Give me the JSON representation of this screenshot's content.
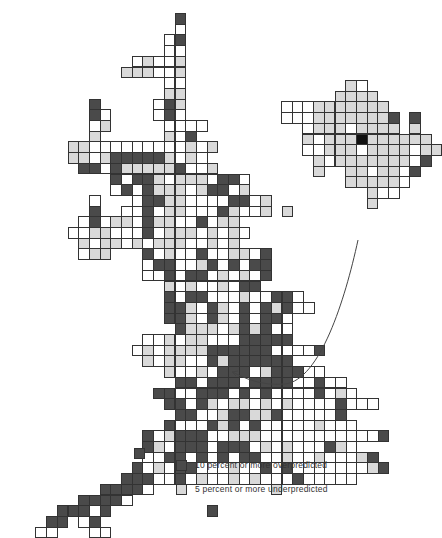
{
  "figure": {
    "type": "grid cartogram map",
    "cell_size": 10.7,
    "main_map_origin": [
      14,
      13
    ],
    "main_map_rows": [
      "...............d",
      "...............w",
      "..............wd",
      "..............ww",
      "...........wgwwg",
      "..........gggwwg",
      "..............ww",
      "..............gg",
      ".......d.....wdg",
      ".......dw....wdw",
      ".......wg.....wwww",
      ".......g......gwd",
      ".....ggwwwwwwwwwgwg",
      ".....ggwgdddddgwgw",
      "......ddwdgggggdwwg",
      ".........dwddgwgggwddw",
      ".........wdwdgggwgddwg",
      ".......w...wddggwwwwddwg",
      ".......d..wwdwggwwwdgwwg.g",
      "......wdwggwdggwwdwgg",
      ".....wwggwwwdwgggwgwgw",
      "......gwggwgwgggwwgwg",
      "......wgg...dwgwwdwwggwd",
      "............wddwwgdwdwdd",
      "............wwdwddwgwgwd",
      "..............gwgwwgwdd",
      "..............dwddwwwgwwddw",
      "..............ddgwdgwdwdgdww",
      "..............ddgwdgwdwddw",
      "...............dgggwgdgdww",
      "............wwgwggwwwddddd",
      "...........wgwggggddddddwwwwd",
      "............gwggwwdgdddddd",
      "..............gwwgwdddwgdddww",
      "...............ddwdddwddddwwdww",
      ".............ddwwdddwdwdwwwwdwgw",
      "..............ddwdgwggwgwgwwwwdwww",
      "...............ddwwgddggdwwwwwd",
      "..............dwwwdgdwdwwwwwgwww",
      "............dwgdddwwgggwwwwwwwwwwwd",
      "............dgwdddwdddwgwgwwwdgw",
      "............wwddwdwdwddwwgwwgwwwgd",
      "...........dwgwddwwwgwwdwdwwwwwwwgd",
      "..........dddwwdwgwwgwgwwwdwwwww",
      "........ddddw...........g",
      "......ddddw",
      "....dddwd.........d",
      "...dd.wd",
      "..ww...ww"
    ],
    "inset_map_origin": [
      281,
      80
    ],
    "inset_map_rows": [
      "......gw",
      ".....gggg",
      "wwwggggggg",
      "wwwgggggggd.d",
      "..wgggwgggg.g",
      "..gwgggkgggggg",
      "..wwgggwggggwgg",
      "...gwgggggggwd",
      "...g..ggwggwd",
      "......gggggw",
      "........gww",
      "........g"
    ]
  },
  "legend": {
    "items": [
      {
        "label": "10 percent or more overpredicted",
        "color": "#4a4a4a"
      },
      {
        "label": "5 percent or more underpredicted",
        "color": "#d9d9d9"
      }
    ]
  },
  "annotations": {
    "arrow": "curved line from inset (Northern Ireland) to main map"
  }
}
